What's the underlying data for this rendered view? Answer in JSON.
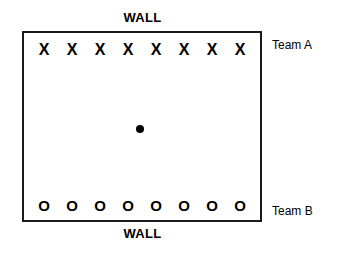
{
  "diagram": {
    "walls": {
      "top_label": "WALL",
      "bottom_label": "WALL"
    },
    "field": {
      "border_color": "#1a1a1a",
      "background_color": "#ffffff"
    },
    "center_object": {
      "name": "ball",
      "color": "#000000"
    },
    "teams": [
      {
        "id": "team-a",
        "label": "Team A",
        "marker": "X",
        "position": "top",
        "count": 8,
        "players": [
          "X",
          "X",
          "X",
          "X",
          "X",
          "X",
          "X",
          "X"
        ]
      },
      {
        "id": "team-b",
        "label": "Team B",
        "marker": "O",
        "position": "bottom",
        "count": 8,
        "players": [
          "O",
          "O",
          "O",
          "O",
          "O",
          "O",
          "O",
          "O"
        ]
      }
    ]
  }
}
